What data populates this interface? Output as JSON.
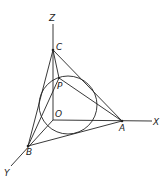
{
  "diagram": {
    "type": "3d-coordinate-tetrahedron-with-inscribed-circle",
    "points": {
      "O": {
        "label": "O",
        "x": 53,
        "y": 120,
        "lx": 55,
        "ly": 117
      },
      "A": {
        "label": "A",
        "x": 122,
        "y": 121,
        "lx": 119,
        "ly": 131
      },
      "B": {
        "label": "B",
        "x": 28,
        "y": 146,
        "lx": 26,
        "ly": 155
      },
      "C": {
        "label": "C",
        "x": 53,
        "y": 50,
        "lx": 56,
        "ly": 50
      },
      "P": {
        "label": "P",
        "x": 59,
        "y": 78,
        "lx": 57,
        "ly": 89
      }
    },
    "axes": {
      "X": {
        "label": "X",
        "x2": 152,
        "y2": 121,
        "lx": 153,
        "ly": 125
      },
      "Y": {
        "label": "Y",
        "x2": 11,
        "y2": 166,
        "lx": 4,
        "ly": 176
      },
      "Z": {
        "label": "Z",
        "x2": 53,
        "y2": 24,
        "lx": 49,
        "ly": 21
      }
    },
    "circle": {
      "cx": 68,
      "cy": 105,
      "r": 29
    },
    "stroke_color": "#222222"
  }
}
